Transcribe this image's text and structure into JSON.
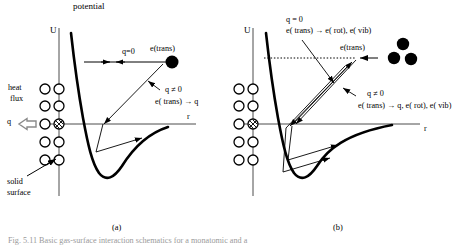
{
  "figure": {
    "domain": "scientific-diagram",
    "title_top": "potential",
    "caption_partial": "Fig. 5.11  Basic gas-surface interaction schematics for a monatomic and a",
    "colors": {
      "ink": "#000000",
      "axis": "#4d4d4d",
      "caption": "#9a9a9a",
      "surface_atom_fill": "#ffffff",
      "gas_particle_fill": "#000000"
    }
  },
  "panel_a": {
    "caption": "(a)",
    "axis_y_label": "U",
    "axis_x_label": "r",
    "labels": {
      "heat_line1": "heat",
      "heat_line2": "flux",
      "q_symbol": "q",
      "solid_line1": "solid",
      "solid_line2": "surface",
      "elastic_condition": "q=0",
      "e_trans": "e(trans)",
      "inelastic_condition": "q ≠ 0",
      "inelastic_process": "e( trans) → q"
    }
  },
  "panel_b": {
    "caption": "(b)",
    "axis_y_label": "U",
    "axis_x_label": "r",
    "labels": {
      "elastic_condition": "q = 0",
      "elastic_process": "e( trans) → e( rot), e( vib)",
      "e_trans": "e(trans)",
      "inelastic_condition": "q ≠ 0",
      "inelastic_process": "e( trans) → q, e( rot), e( vib)"
    }
  }
}
